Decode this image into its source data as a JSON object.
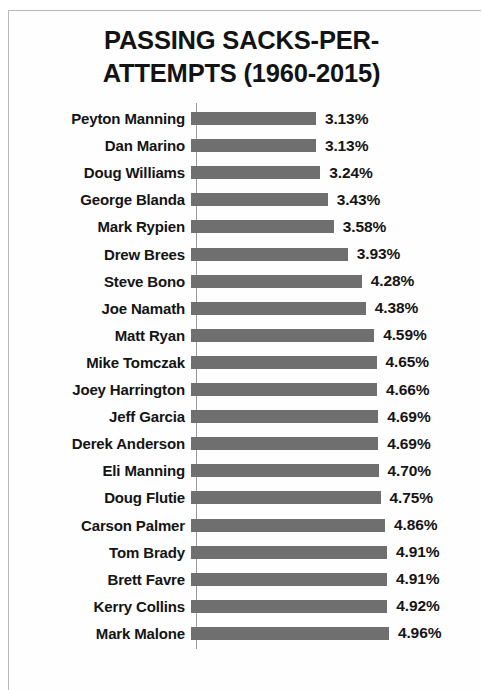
{
  "chart_data": {
    "type": "bar",
    "orientation": "horizontal",
    "title": "PASSING SACKS-PER-\nATTEMPTS (1960-2015)",
    "title_line_1": "PASSING SACKS-PER-",
    "title_line_2": "ATTEMPTS (1960-2015)",
    "xlabel": "",
    "ylabel": "",
    "grid": false,
    "legend": false,
    "xlim": [
      0,
      4.96
    ],
    "value_suffix": "%",
    "bar_color": "#6f6f6f",
    "text_color": "#141414",
    "categories": [
      "Peyton Manning",
      "Dan Marino",
      "Doug Williams",
      "George Blanda",
      "Mark Rypien",
      "Drew Brees",
      "Steve Bono",
      "Joe Namath",
      "Matt Ryan",
      "Mike Tomczak",
      "Joey Harrington",
      "Jeff Garcia",
      "Derek Anderson",
      "Eli Manning",
      "Doug Flutie",
      "Carson Palmer",
      "Tom Brady",
      "Brett Favre",
      "Kerry Collins",
      "Mark Malone"
    ],
    "values": [
      3.13,
      3.13,
      3.24,
      3.43,
      3.58,
      3.93,
      4.28,
      4.38,
      4.59,
      4.65,
      4.66,
      4.69,
      4.69,
      4.7,
      4.75,
      4.86,
      4.91,
      4.91,
      4.92,
      4.96
    ],
    "data_labels": [
      "3.13%",
      "3.13%",
      "3.24%",
      "3.43%",
      "3.58%",
      "3.93%",
      "4.28%",
      "4.38%",
      "4.59%",
      "4.65%",
      "4.66%",
      "4.69%",
      "4.69%",
      "4.70%",
      "4.75%",
      "4.86%",
      "4.91%",
      "4.91%",
      "4.92%",
      "4.96%"
    ]
  }
}
